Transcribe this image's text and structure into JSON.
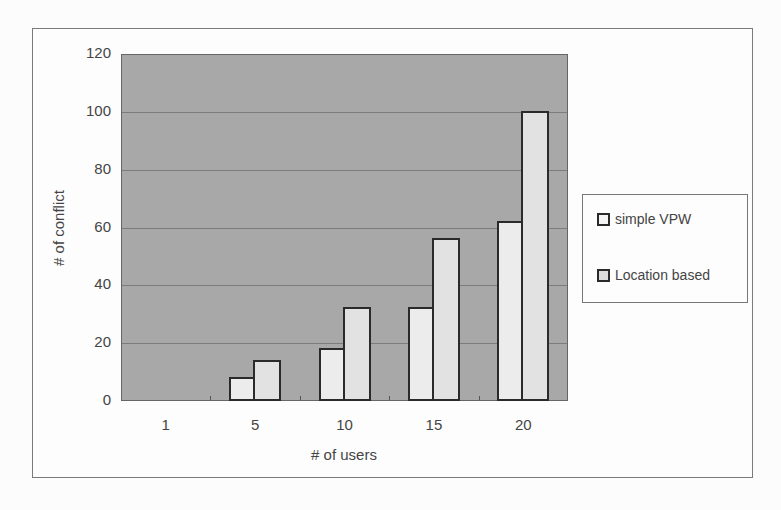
{
  "chart_data": {
    "type": "bar",
    "title": "",
    "xlabel": "# of users",
    "ylabel": "# of conflict",
    "categories": [
      "1",
      "5",
      "10",
      "15",
      "20"
    ],
    "series": [
      {
        "name": "simple VPW",
        "values": [
          0,
          8,
          18,
          32,
          62
        ],
        "color": "#ececec"
      },
      {
        "name": "Location based",
        "values": [
          0,
          14,
          32,
          56,
          100
        ],
        "color": "#e2e2e2"
      }
    ],
    "ylim": [
      0,
      120
    ],
    "yticks": [
      "0",
      "20",
      "40",
      "60",
      "80",
      "100",
      "120"
    ],
    "grid": true,
    "legend_position": "right",
    "plot_background": "#a8a8a8"
  }
}
